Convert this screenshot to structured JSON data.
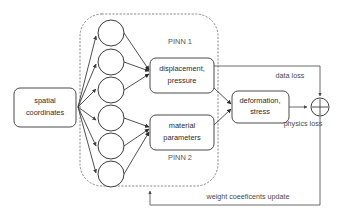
{
  "diagram": {
    "colors": {
      "background": "#ffffff",
      "stroke": "#3d3d3d",
      "dotted_boundary": "#8a8a8a",
      "text": "#2b2b2b"
    },
    "input_node": {
      "name": "spatial-coordinates",
      "line1": "spatial",
      "line2": "coordinates"
    },
    "neurons": [
      {
        "name": "neuron-pinn1-1",
        "cx": 111,
        "cy": 33,
        "r": 13
      },
      {
        "name": "neuron-pinn1-2",
        "cx": 111,
        "cy": 62,
        "r": 13
      },
      {
        "name": "neuron-pinn1-3",
        "cx": 111,
        "cy": 90,
        "r": 13
      },
      {
        "name": "neuron-pinn2-1",
        "cx": 111,
        "cy": 118,
        "r": 13
      },
      {
        "name": "neuron-pinn2-2",
        "cx": 111,
        "cy": 146,
        "r": 13
      },
      {
        "name": "neuron-pinn2-3",
        "cx": 111,
        "cy": 174,
        "r": 13
      }
    ],
    "group_labels": {
      "pinn1": "PINN 1",
      "pinn2": "PINN 2"
    },
    "output_nodes": {
      "displacement": {
        "name": "displacement-pressure",
        "line1": "displacement,",
        "line2": "pressure"
      },
      "material": {
        "name": "material-parameters",
        "line1": "material",
        "line2": "parameters"
      },
      "deformation": {
        "name": "deformation-stress",
        "line1": "deformation,",
        "line2": "stress"
      }
    },
    "edge_labels": {
      "data_loss": "data loss",
      "physics_loss": "physics loss",
      "weight_update": "weight coeeficents update"
    },
    "sum_node": {
      "name": "summation-node",
      "symbol": "+"
    }
  }
}
